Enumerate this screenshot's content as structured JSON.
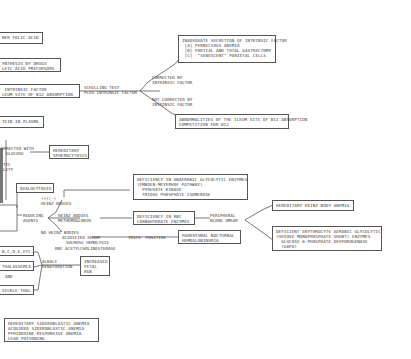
{
  "boxes": {
    "folic_acid": "BER FOLIC ACID",
    "synthesis_drugs": "YNTHESIS BY DRUGS\nLEIC ACID PRECURSORS",
    "intrinsic_ileum": " INTRINSIC FACTOR\nLEUM SITE OF B12 ABSORPTION",
    "inadequate_if": "INADEQUATE SECRETION OF INTRINSIC FACTOR\n [A] PERNICIOUS ANEMIA\n [B] PARTIAL AND TOTAL GASTRECTOMY\n [C]  \"SENESCENT\" PARIETAL CELLS",
    "ileum_abnormal": "ABNORMALITIES OF THE ILEUM SITE OF B12 ABSORPTION\nCOMPETITION FOR B12",
    "protein_plasma": "TEIN IN PLASMA",
    "hereditary_sphero": "HEREDITARY\nSPHEROCYTOSIS",
    "ovalocytosis": "OVALOCYTOSIS",
    "anaerobic_def": "DEFICIENCY IN ANAEROBIC GLYCOLYTIC ENZYMES\n(EMBDEN-MEYERHOF PATHWAY)\n  PYRUVATE KINASE\n  TRIOSE PHOSPHATE ISOMERASE",
    "rbc_carb_def": "DEFICIENCY IN RBC\nCARBOHYDRATE ENZYMES",
    "heinz_anemia": "HEREDITARY HEINZ BODY ANEMIA",
    "aerobic_def": "DEFICIENT ERYTHROCYTE AEROBIC GLYCOLYTIC\n(HEXOSE MONOPHOSPHATE SHUNT) ENZYMES\n  GLUCOSE-6-PHOSPHATE DEHYDROGENASE\n  (G6PD)",
    "pnh": "PAROXYSMAL NOCTURNAL\nHEMOGLOBINURIA",
    "hb_variants": "B,C,D,E,ETC.",
    "thalassemia": "THALASSEMIA",
    "sickle": "SICKLE-THAL",
    "fetal_hgb": "INCREASED\nFETAL\nHGB",
    "sideroblastic": "HEREDITARY SIDEROBLASTIC ANEMIA\nACQUIRED SIDEROBLASTIC ANEMIA\nPYRIDOXINE-RESPONSIVE ANEMIA\nLEAD POISONING"
  },
  "labels": {
    "schilling": "SCHILLING TEST\nPLUS INTRINSIC FACTOR",
    "corrected_if": "CORRECTED BY\nINTRINSIC FACTOR",
    "not_corrected_if": "NOT CORRECTED BY\nINTRINSIC FACTOR",
    "corrected_glucose": "ORRECTED WITH\n  GLUCOSE",
    "tic_ity": "TIC\nLITY",
    "heinz_plus": "(+)(-)\nHEINZ BODIES",
    "reducing_agents": "REDUCING\nAGENTS",
    "heinz_methemo": "HEINZ BODIES\nMETHEMOGLOBIN",
    "no_heinz": "NO HEINZ BODIES",
    "acidified_serum": "ACIDIFIED SERUM",
    "sucrose": "SUCROSE HEMOLYSIS",
    "rbc_ache": "RBC ACETYLCHOLINESTERASE",
    "tests_positive": "TESTS  POSITIVE",
    "peripheral_smear": "PERIPHERAL\nBLOOD SMEAR",
    "alkali": "ALKALI\nDENATURATION",
    "and": "AND",
    "hgb_ref": "SEE ALSO"
  }
}
